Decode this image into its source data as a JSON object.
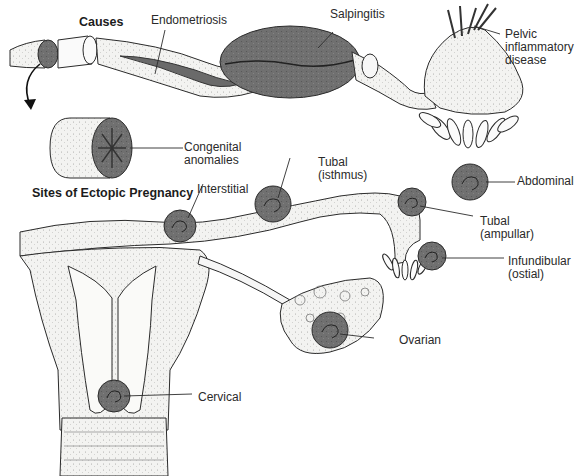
{
  "diagram": {
    "sections": {
      "causes": {
        "title": "Causes"
      },
      "sites": {
        "title": "Sites of Ectopic Pregnancy"
      }
    },
    "causes_labels": [
      {
        "id": "endometriosis",
        "text": "Endometriosis"
      },
      {
        "id": "salpingitis",
        "text": "Salpingitis"
      },
      {
        "id": "pid",
        "text": "Pelvic\ninflammatory\ndisease"
      },
      {
        "id": "congenital",
        "text": "Congenital\nanomalies"
      }
    ],
    "site_labels": [
      {
        "id": "interstitial",
        "text": "Interstitial"
      },
      {
        "id": "isthmus",
        "text": "Tubal\n(isthmus)"
      },
      {
        "id": "abdominal",
        "text": "Abdominal"
      },
      {
        "id": "ampullar",
        "text": "Tubal\n(ampullar)"
      },
      {
        "id": "infundibular",
        "text": "Infundibular\n(ostial)"
      },
      {
        "id": "ovarian",
        "text": "Ovarian"
      },
      {
        "id": "cervical",
        "text": "Cervical"
      }
    ],
    "colors": {
      "line": "#2b2b2b",
      "tissue_fill": "#f4f4f2",
      "lesion_fill": "#6e6e6e",
      "lesion_dark": "#4a4a4a",
      "background": "#ffffff"
    }
  }
}
